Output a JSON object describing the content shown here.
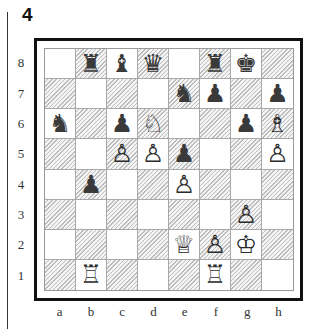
{
  "diagram": {
    "number": "4",
    "hatch_color": "#bdbdbd",
    "frame_color": "#111111"
  },
  "ranks": [
    "8",
    "7",
    "6",
    "5",
    "4",
    "3",
    "2",
    "1"
  ],
  "files": [
    "a",
    "b",
    "c",
    "d",
    "e",
    "f",
    "g",
    "h"
  ],
  "position": {
    "rank8": [
      "",
      "♜",
      "♝",
      "♛",
      "",
      "♜",
      "♚",
      ""
    ],
    "rank7": [
      "",
      "",
      "",
      "",
      "♞",
      "♟",
      "",
      "♟"
    ],
    "rank6": [
      "♞",
      "",
      "♟",
      "♘",
      "",
      "",
      "♟",
      "♗"
    ],
    "rank5": [
      "",
      "",
      "♙",
      "♙",
      "♟",
      "",
      "",
      "♙"
    ],
    "rank4": [
      "",
      "♟",
      "",
      "",
      "♙",
      "",
      "",
      ""
    ],
    "rank3": [
      "",
      "",
      "",
      "",
      "",
      "",
      "♙",
      ""
    ],
    "rank2": [
      "",
      "",
      "",
      "",
      "♕",
      "♙",
      "♔",
      ""
    ],
    "rank1": [
      "",
      "♖",
      "",
      "",
      "",
      "♖",
      "",
      ""
    ]
  },
  "pieces_list": {
    "white": [
      "Rb1",
      "Rf1",
      "Qe2",
      "Kg2",
      "Pf2",
      "Pg3",
      "Pe4",
      "Pc5",
      "Pd5",
      "Ph5",
      "Nd6",
      "Bh6"
    ],
    "black": [
      "Rb8",
      "Bc8",
      "Qd8",
      "Rf8",
      "Kg8",
      "Ne7",
      "Pf7",
      "Ph7",
      "Na6",
      "Pc6",
      "Pg6",
      "Pe5",
      "Pb4"
    ]
  }
}
